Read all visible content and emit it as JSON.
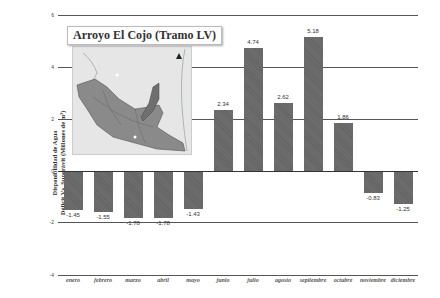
{
  "chart_data": {
    "type": "bar",
    "title": "Arroyo El Cojo (Tramo LV)",
    "xlabel": "",
    "ylabel": "Disponibilidad de Agua Déficit Vs. Superávit (Millones de m³)",
    "ylabel_lines": [
      "Disponibilidad de Agua",
      "Déficit Vs. Superávit (Millones de m³)"
    ],
    "categories": [
      "enero",
      "febrero",
      "marzo",
      "abril",
      "mayo",
      "junio",
      "julio",
      "agosto",
      "septiembre",
      "octubre",
      "noviembre",
      "diciembre"
    ],
    "values": [
      -1.45,
      -1.55,
      -1.78,
      -1.78,
      -1.43,
      2.34,
      4.74,
      2.62,
      5.18,
      1.86,
      -0.83,
      -1.25
    ],
    "value_labels": [
      "-1.45",
      "-1.55",
      "-1.78",
      "-1.78",
      "-1.43",
      "2.34",
      "4.74",
      "2.62",
      "5.18",
      "1.86",
      "-0.83",
      "-1.25"
    ],
    "yticks": [
      "6",
      "4",
      "2",
      "0",
      "-2",
      "-4"
    ],
    "ylim": [
      -4,
      6
    ],
    "grid": true,
    "legend": null,
    "bar_color": "#6e6e6e",
    "inset": "map of Arroyo El Cojo watershed (Tramo LV)"
  }
}
